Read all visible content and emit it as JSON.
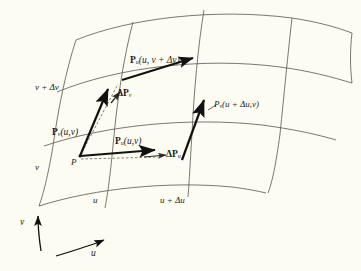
{
  "figure": {
    "background_color": "#fdfcf2",
    "ink_color": "#1a1a1a",
    "grid_line_color": "#5c5c58",
    "width": 361,
    "height": 271
  },
  "axes": {
    "u_label": "u",
    "v_label": "v"
  },
  "grid_labels": {
    "v_plus_dv": "v + Δv",
    "v": "v",
    "u": "u",
    "u_plus_du": "u + Δu"
  },
  "points": {
    "p": "P"
  },
  "vectors": [
    {
      "id": "pu-u-v-plus-dv",
      "bold_symbol": "P",
      "subscript": "u",
      "args": "(u, v + Δv)",
      "description": "tangent vector in u direction at v + Δv"
    },
    {
      "id": "delta-pv",
      "bold_symbol": "ΔP",
      "subscript": "v",
      "args": "",
      "description": "difference vector in v direction"
    },
    {
      "id": "pv-u-v",
      "bold_symbol": "P",
      "subscript": "v",
      "args": "(u,v)",
      "description": "tangent vector in v direction at P"
    },
    {
      "id": "pu-u-v",
      "bold_symbol": "P",
      "subscript": "u",
      "args": "(u,v)",
      "description": "tangent vector in u direction at P"
    },
    {
      "id": "delta-pu",
      "bold_symbol": "ΔP",
      "subscript": "u",
      "args": "",
      "description": "difference vector in u direction"
    },
    {
      "id": "pv-u-plus-du-v",
      "bold_symbol": "P",
      "subscript": "v",
      "args": "(u + Δu,v)",
      "italic_symbol": true,
      "description": "tangent vector in v direction at u + Δu"
    }
  ]
}
